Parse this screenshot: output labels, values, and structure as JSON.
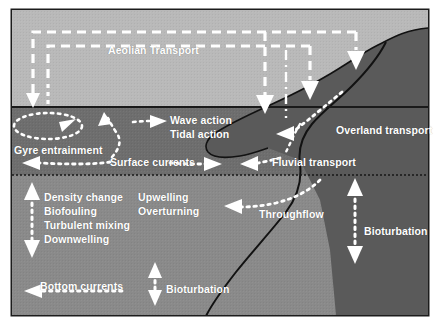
{
  "figure": {
    "title_text": "",
    "colors": {
      "frame_border": "#1c1c1c",
      "sky": "#b9b9b9",
      "surface_ocean": "#6e6e6e",
      "deep_ocean": "#8a8a8a",
      "land": "#5a5a5a",
      "arrow_white": "#ffffff",
      "river_line": "#111111",
      "label_text": "#ffffff"
    }
  },
  "zones": [
    {
      "id": "atmosphere",
      "name": "sky-band"
    },
    {
      "id": "surface-ocean",
      "name": "surface-ocean-band"
    },
    {
      "id": "deep-ocean",
      "name": "deep-ocean-band"
    },
    {
      "id": "landmass",
      "name": "land-body"
    }
  ],
  "labels": {
    "aeolian_transport": "Aeolian Transport",
    "wave_action": "Wave action",
    "tidal_action": "Tidal action",
    "gyre_entrainment": "Gyre entrainment",
    "surface_currents": "Surface currents",
    "overland_transport": "Overland transport",
    "fluvial_transport": "Fluvial transport",
    "density_change": "Density change",
    "biofouling": "Biofouling",
    "turbulent_mixing": "Turbulent mixing",
    "downwelling": "Downwelling",
    "upwelling": "Upwelling",
    "overturning": "Overturning",
    "throughflow": "Throughflow",
    "bioturbation_right": "Bioturbation",
    "bioturbation_bottom": "Bioturbation",
    "bottom_currents": "Bottom currents"
  },
  "arrows": [
    {
      "name": "aeolian-dashed-loop-outer",
      "style": "dashed",
      "direction": "down",
      "zone": "atmosphere"
    },
    {
      "name": "aeolian-dashed-loop-inner",
      "style": "dashed",
      "direction": "down",
      "zone": "atmosphere"
    },
    {
      "name": "aeolian-dashed-to-sea-left",
      "style": "dashed",
      "direction": "down",
      "zone": "atmosphere"
    },
    {
      "name": "aeolian-dashed-to-sea-mid",
      "style": "dashed",
      "direction": "down",
      "zone": "atmosphere"
    },
    {
      "name": "aeolian-dashed-to-land-inner",
      "style": "dashed",
      "direction": "down",
      "zone": "landmass"
    },
    {
      "name": "aeolian-dashed-to-land-outer",
      "style": "dashed",
      "direction": "down",
      "zone": "landmass"
    },
    {
      "name": "gyre-entrainment-ellipse",
      "style": "dotted",
      "direction": "clockwise",
      "zone": "surface-ocean"
    },
    {
      "name": "surface-current-left",
      "style": "dotted",
      "direction": "left",
      "zone": "surface-ocean"
    },
    {
      "name": "surface-current-right",
      "style": "dotted",
      "direction": "right",
      "zone": "surface-ocean"
    },
    {
      "name": "wave-action-arrow",
      "style": "dotted",
      "direction": "right",
      "zone": "surface-ocean"
    },
    {
      "name": "tidal-upward-arrow",
      "style": "dotted",
      "direction": "up-left",
      "zone": "surface-ocean"
    },
    {
      "name": "fluvial-transport-arrow",
      "style": "dotted",
      "direction": "left",
      "zone": "surface-ocean"
    },
    {
      "name": "overland-transport-arrow",
      "style": "dotted",
      "direction": "down-left",
      "zone": "landmass"
    },
    {
      "name": "mixing-double-arrow",
      "style": "dotted",
      "direction": "vertical-both",
      "zone": "deep-ocean"
    },
    {
      "name": "throughflow-arrow",
      "style": "dotted",
      "direction": "left",
      "zone": "deep-ocean"
    },
    {
      "name": "bioturbation-right-double-arrow",
      "style": "dotted",
      "direction": "vertical-both",
      "zone": "deep-ocean"
    },
    {
      "name": "bioturbation-bottom-double-arrow",
      "style": "dotted",
      "direction": "vertical-both",
      "zone": "deep-ocean"
    },
    {
      "name": "bottom-currents-arrow",
      "style": "dotted",
      "direction": "left",
      "zone": "deep-ocean"
    }
  ]
}
